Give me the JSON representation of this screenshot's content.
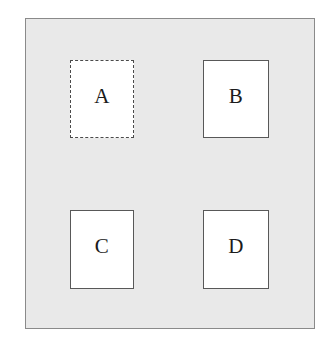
{
  "diagram": {
    "canvas": {
      "background_color": "#e9e9e9",
      "border_color": "#8a8a8a"
    },
    "nodes": [
      {
        "id": "a",
        "label": "A",
        "border_style": "dashed",
        "border_color": "#4a4a4a",
        "fill_color": "#ffffff",
        "position": "top-left",
        "selected": "true"
      },
      {
        "id": "b",
        "label": "B",
        "border_style": "solid",
        "border_color": "#585858",
        "fill_color": "#ffffff",
        "position": "top-right",
        "selected": "false"
      },
      {
        "id": "c",
        "label": "C",
        "border_style": "solid",
        "border_color": "#585858",
        "fill_color": "#ffffff",
        "position": "bottom-left",
        "selected": "false"
      },
      {
        "id": "d",
        "label": "D",
        "border_style": "solid",
        "border_color": "#585858",
        "fill_color": "#ffffff",
        "position": "bottom-right",
        "selected": "false"
      }
    ]
  }
}
